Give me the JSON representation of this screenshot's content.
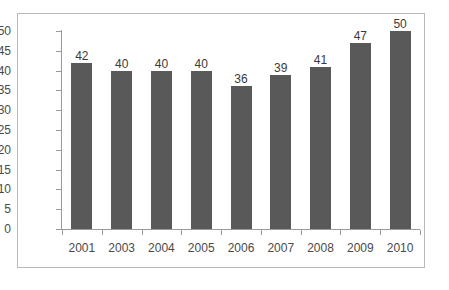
{
  "chart_data": {
    "type": "bar",
    "title": "",
    "subtitle": "",
    "xlabel": "",
    "ylabel": "",
    "categories": [
      "2001",
      "2003",
      "2004",
      "2005",
      "2006",
      "2007",
      "2008",
      "2009",
      "2010"
    ],
    "values": [
      42,
      40,
      40,
      40,
      36,
      39,
      41,
      47,
      50
    ],
    "data_labels": [
      "42",
      "40",
      "40",
      "40",
      "36",
      "39",
      "41",
      "47",
      "50"
    ],
    "ylim": [
      0,
      50
    ],
    "ytick_values": [
      50,
      45,
      40,
      35,
      30,
      25,
      20,
      15,
      10,
      5,
      0
    ],
    "ytick_labels": [
      "50",
      "45",
      "40",
      "35",
      "30",
      "25",
      "20",
      "15",
      "10",
      "5",
      "0"
    ],
    "grid": false,
    "legend": null,
    "legend_position": "none",
    "bar_color": "#595959",
    "axis_color": "#9a9a9a",
    "border_color": "#b9b9b9",
    "label_color": "#4a4a4a",
    "background_color": "#ffffff"
  }
}
